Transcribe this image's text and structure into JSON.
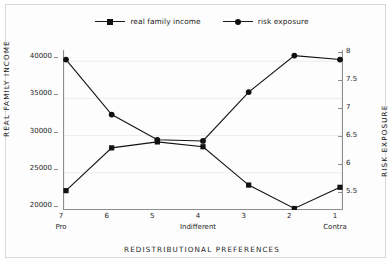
{
  "chart_data": {
    "type": "line",
    "title": "",
    "xlabel": "REDISTRIBUTIONAL PREFERENCES",
    "ylabel": "REAL FAMILY INCOME",
    "y2label": "RISK EXPOSURE",
    "categories": [
      "7",
      "6",
      "5",
      "4",
      "3",
      "2",
      "1"
    ],
    "category_sublabels": [
      {
        "index": 0,
        "text": "Pro"
      },
      {
        "index": 3,
        "text": "Indifferent"
      },
      {
        "index": 6,
        "text": "Contra"
      }
    ],
    "ylim": [
      20000,
      41500
    ],
    "y2lim": [
      5.25,
      8.1
    ],
    "yticks": [
      "20000",
      "25000",
      "30000",
      "35000",
      "40000"
    ],
    "ytick_values": [
      20000,
      25000,
      30000,
      35000,
      40000
    ],
    "y2ticks": [
      "5.5",
      "6",
      "6.5",
      "7",
      "7.5",
      "8"
    ],
    "y2tick_values": [
      5.5,
      6,
      6.5,
      7,
      7.5,
      8
    ],
    "grid": true,
    "legend_position": "top-center",
    "series": [
      {
        "name": "real family income",
        "axis": "left",
        "marker": "square",
        "color": "#111111",
        "values": [
          22600,
          28350,
          29150,
          28500,
          23350,
          20200,
          23050
        ]
      },
      {
        "name": "risk exposure",
        "axis": "right",
        "marker": "circle",
        "color": "#111111",
        "values": [
          7.93,
          6.95,
          6.5,
          6.48,
          7.35,
          8.0,
          7.93
        ]
      }
    ]
  },
  "legend": {
    "items": [
      {
        "label": "real family income",
        "marker": "square"
      },
      {
        "label": "risk exposure",
        "marker": "circle"
      }
    ]
  }
}
